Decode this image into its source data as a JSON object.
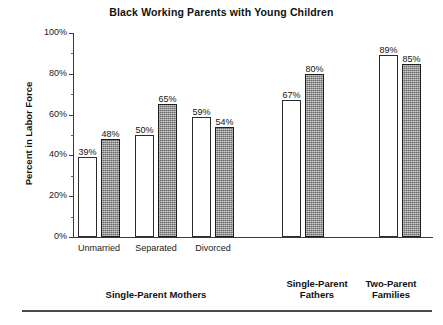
{
  "chart_data": {
    "type": "bar",
    "title": "Black Working Parents with Young Children",
    "xlabel": "",
    "ylabel": "Percent in Labor Force",
    "ylim": [
      0,
      100
    ],
    "ytick_labels": [
      "0%",
      "20%",
      "40%",
      "60%",
      "80%",
      "100%"
    ],
    "ytick_values": [
      0,
      20,
      40,
      60,
      80,
      100
    ],
    "yminor_values": [
      10,
      30,
      50,
      70,
      90
    ],
    "grid": false,
    "legend": "none",
    "categories": [
      "Unmarried",
      "Separated",
      "Divorced",
      "Single-Parent Fathers",
      "Two-Parent Families"
    ],
    "series": [
      {
        "name": "white-bar",
        "fill": "white",
        "values": [
          39,
          50,
          59,
          67,
          89
        ]
      },
      {
        "name": "gray-bar",
        "fill": "gray",
        "values": [
          48,
          65,
          54,
          80,
          85
        ]
      }
    ],
    "bars": [
      {
        "label": "39%",
        "value": 39,
        "fill": "white",
        "x": 5,
        "width": 19
      },
      {
        "label": "48%",
        "value": 48,
        "fill": "gray",
        "x": 28,
        "width": 19
      },
      {
        "label": "50%",
        "value": 50,
        "fill": "white",
        "x": 62,
        "width": 19
      },
      {
        "label": "65%",
        "value": 65,
        "fill": "gray",
        "x": 85,
        "width": 19
      },
      {
        "label": "59%",
        "value": 59,
        "fill": "white",
        "x": 119,
        "width": 19
      },
      {
        "label": "54%",
        "value": 54,
        "fill": "gray",
        "x": 142,
        "width": 19
      },
      {
        "label": "67%",
        "value": 67,
        "fill": "white",
        "x": 209,
        "width": 19
      },
      {
        "label": "80%",
        "value": 80,
        "fill": "gray",
        "x": 232,
        "width": 19
      },
      {
        "label": "89%",
        "value": 89,
        "fill": "white",
        "x": 306,
        "width": 19
      },
      {
        "label": "85%",
        "value": 85,
        "fill": "gray",
        "x": 329,
        "width": 19
      }
    ],
    "category_ticks": [
      {
        "label": "Unmarried",
        "center": 26
      },
      {
        "label": "Separated",
        "center": 83
      },
      {
        "label": "Divorced",
        "center": 140
      }
    ],
    "group_headings": [
      {
        "label": "Single-Parent Mothers",
        "center": 156,
        "top": 289
      },
      {
        "label": "Single-Parent\nFathers",
        "center": 317,
        "top": 278
      },
      {
        "label": "Two-Parent\nFamilies",
        "center": 391,
        "top": 278
      }
    ],
    "colors": {
      "bar_white": "#ffffff",
      "bar_gray": "#9a9a9a",
      "bar_outline": "#2b2b2b",
      "axis": "#3a3a3a",
      "text": "#1a1a1a",
      "background": "#ffffff",
      "footer_rule": "#4a4a4a"
    }
  }
}
